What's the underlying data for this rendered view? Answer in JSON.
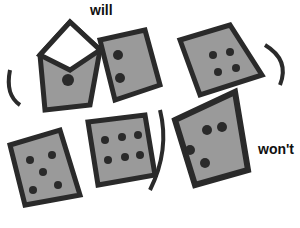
{
  "labels": {
    "top": "will",
    "right": "won't"
  },
  "dice": [
    {
      "id": "die-top-left",
      "pips": 1
    },
    {
      "id": "die-top-center",
      "pips": 2
    },
    {
      "id": "die-top-right",
      "pips": 4
    },
    {
      "id": "die-bottom-left",
      "pips": 5
    },
    {
      "id": "die-bottom-center",
      "pips": 6
    },
    {
      "id": "die-bottom-right",
      "pips": 4
    }
  ],
  "colors": {
    "ink": "#2a2a2a",
    "shade": "#9a9a9a",
    "background": "#ffffff"
  }
}
